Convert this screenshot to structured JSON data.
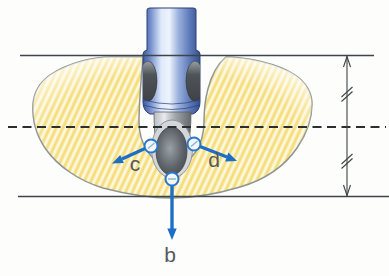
{
  "diagram": {
    "description_labels": {
      "b": "b",
      "c": "c",
      "d": "d"
    },
    "colors": {
      "arrow_blue": "#1d6fc6",
      "marker_ring_blue": "#2b77c9",
      "flow_fill": "#fdf8e0",
      "flow_stripe": "#f5dd7a",
      "flow_outline": "#8e9692",
      "body_blue_dark": "#3a5699",
      "body_blue_light": "#e9f0fb",
      "nozzle_gray": "#9fa5aa",
      "boundary_line": "#3e4447",
      "label_gray": "#55595c"
    }
  }
}
